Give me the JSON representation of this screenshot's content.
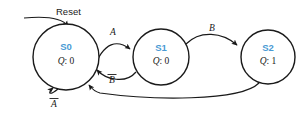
{
  "diagram": {
    "type": "finite-state-machine",
    "title": "",
    "reset": {
      "label": "Reset",
      "target_state": "S0"
    },
    "states": [
      {
        "id": "S0",
        "name": "S0",
        "output_label": "Q",
        "output_separator": ": ",
        "output_value": "0",
        "cx": 66,
        "cy": 57,
        "r": 33,
        "initial": true
      },
      {
        "id": "S1",
        "name": "S1",
        "output_label": "Q",
        "output_separator": ": ",
        "output_value": "0",
        "cx": 161,
        "cy": 57,
        "r": 28,
        "initial": false
      },
      {
        "id": "S2",
        "name": "S2",
        "output_label": "Q",
        "output_separator": ": ",
        "output_value": "1",
        "cx": 268,
        "cy": 57,
        "r": 27,
        "initial": false
      }
    ],
    "transitions": [
      {
        "id": "s0-to-s1",
        "from": "S0",
        "to": "S1",
        "label": "A",
        "overline": false,
        "label_x": 113,
        "label_y": 33
      },
      {
        "id": "s1-to-s0",
        "from": "S1",
        "to": "S0",
        "label": "B",
        "overline": true,
        "label_x": 112,
        "label_y": 80
      },
      {
        "id": "s1-to-s2",
        "from": "S1",
        "to": "S2",
        "label": "B",
        "overline": false,
        "label_x": 212,
        "label_y": 31
      },
      {
        "id": "s2-to-s0",
        "from": "S2",
        "to": "S0",
        "label": "",
        "overline": false,
        "label_x": 0,
        "label_y": 0
      },
      {
        "id": "s0-self-loop",
        "from": "S0",
        "to": "S0",
        "label": "A",
        "overline": true,
        "label_x": 54,
        "label_y": 104
      }
    ],
    "colors": {
      "state_name": "#4a9ad4",
      "stroke": "#1a1a1a",
      "text": "#1a1a1a",
      "background": "#ffffff"
    }
  }
}
